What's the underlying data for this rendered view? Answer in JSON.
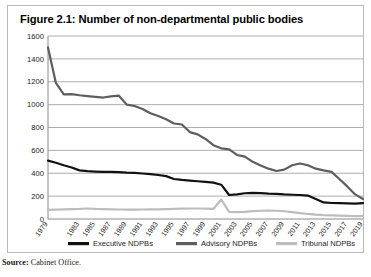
{
  "figure": {
    "title": "Figure 2.1: Number of non-departmental public bodies",
    "source_prefix": "Source:",
    "source_text": "Cabinet Office."
  },
  "chart_data": {
    "type": "line",
    "title": "Figure 2.1: Number of non-departmental public bodies",
    "xlabel": "",
    "ylabel": "",
    "ylim": [
      0,
      1600
    ],
    "ytick_step": 200,
    "yticks": [
      "0",
      "200",
      "400",
      "600",
      "800",
      "1000",
      "1200",
      "1400",
      "1600"
    ],
    "grid": true,
    "legend_position": "bottom",
    "x": [
      1979,
      1980,
      1981,
      1982,
      1983,
      1984,
      1985,
      1986,
      1987,
      1988,
      1989,
      1990,
      1991,
      1992,
      1993,
      1994,
      1995,
      1996,
      1997,
      1998,
      1999,
      2000,
      2001,
      2002,
      2003,
      2004,
      2005,
      2006,
      2007,
      2008,
      2009,
      2010,
      2011,
      2012,
      2013,
      2014,
      2015,
      2016,
      2017,
      2018,
      2019
    ],
    "xticks": [
      "1979",
      "1983",
      "1985",
      "1987",
      "1989",
      "1991",
      "1993",
      "1995",
      "1997",
      "1999",
      "2001",
      "2003",
      "2005",
      "2007",
      "2009",
      "2011",
      "2013",
      "2015",
      "2017",
      "2019"
    ],
    "xtick_values": [
      1979,
      1983,
      1985,
      1987,
      1989,
      1991,
      1993,
      1995,
      1997,
      1999,
      2001,
      2003,
      2005,
      2007,
      2009,
      2011,
      2013,
      2015,
      2017,
      2019
    ],
    "series": [
      {
        "name": "Executive NDPBs",
        "color": "#111111",
        "width": 2.2,
        "values": [
          510,
          492,
          470,
          450,
          425,
          418,
          415,
          412,
          412,
          410,
          406,
          404,
          398,
          392,
          385,
          375,
          350,
          342,
          336,
          330,
          325,
          318,
          300,
          210,
          215,
          225,
          228,
          226,
          222,
          220,
          215,
          212,
          210,
          205,
          175,
          145,
          140,
          138,
          136,
          135,
          138
        ]
      },
      {
        "name": "Advisory NDPBs",
        "color": "#5e5e5e",
        "width": 2.2,
        "values": [
          1500,
          1190,
          1090,
          1092,
          1082,
          1075,
          1068,
          1062,
          1072,
          1078,
          1000,
          988,
          962,
          925,
          900,
          872,
          835,
          826,
          760,
          740,
          700,
          645,
          618,
          608,
          560,
          545,
          500,
          468,
          440,
          420,
          432,
          470,
          485,
          470,
          440,
          425,
          412,
          350,
          285,
          215,
          175
        ]
      },
      {
        "name": "Tribunal NDPBs",
        "color": "#bdbdbd",
        "width": 2.2,
        "values": [
          80,
          82,
          84,
          86,
          88,
          92,
          88,
          86,
          84,
          83,
          82,
          82,
          83,
          84,
          85,
          86,
          88,
          90,
          92,
          92,
          90,
          88,
          170,
          62,
          60,
          62,
          68,
          72,
          74,
          72,
          68,
          60,
          52,
          44,
          38,
          34,
          32,
          30,
          28,
          26,
          25
        ]
      }
    ],
    "annotations": []
  },
  "legend": {
    "items": [
      {
        "label": "Executive NDPBs",
        "color": "#111111"
      },
      {
        "label": "Advisory NDPBs",
        "color": "#5e5e5e"
      },
      {
        "label": "Tribunal NDPBs",
        "color": "#bdbdbd"
      }
    ]
  }
}
